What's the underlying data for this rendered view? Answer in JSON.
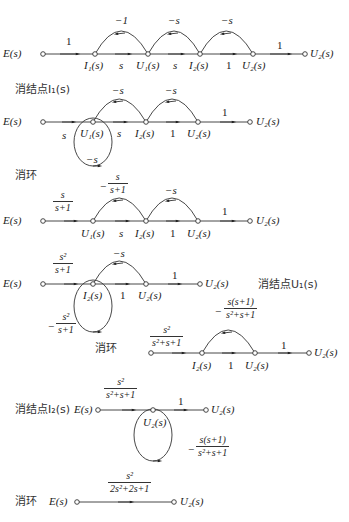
{
  "graphs": [
    {
      "id": "g1",
      "nodes": [
        "E(s)",
        "I1(s)",
        "U1(s)",
        "I2(s)",
        "U2(s)",
        "U2(s)"
      ],
      "labels": {
        "e": "E(s)",
        "i1": "I₁(s)",
        "u1": "U₁(s)",
        "i2": "I₂(s)",
        "u2": "U₂(s)",
        "out": "U₂(s)",
        "g_e_i1": "1",
        "g_i1_u1": "s",
        "g_u1_i2": "s",
        "g_i2_u2": "1",
        "g_u2_out": "1",
        "fb1": "−1",
        "fb2": "−s",
        "fb3": "−s"
      }
    },
    {
      "id": "g2",
      "step": "消结点I₁(s)",
      "labels": {
        "e": "E(s)",
        "u1": "U₁(s)",
        "i2": "I₂(s)",
        "u2": "U₂(s)",
        "out": "U₂(s)",
        "g_e_u1": "s",
        "g_u1_i2": "s",
        "g_i2_u2": "1",
        "g_u2_out": "1",
        "fb1": "−s",
        "fb2": "−s",
        "self_loop": "−s"
      }
    },
    {
      "id": "g3",
      "step": "消环",
      "labels": {
        "e": "E(s)",
        "u1": "U₁(s)",
        "i2": "I₂(s)",
        "u2": "U₂(s)",
        "out": "U₂(s)",
        "g_e_u1_num": "s",
        "g_e_u1_den": "s+1",
        "fb1_sign": "−",
        "fb1_num": "s",
        "fb1_den": "s+1",
        "g_u1_i2": "s",
        "g_i2_u2": "1",
        "g_u2_out": "1",
        "fb2": "−s"
      }
    },
    {
      "id": "g4",
      "step": "消结点U₁(s)",
      "labels": {
        "e": "E(s)",
        "i2": "I₂(s)",
        "u2": "U₂(s)",
        "out": "U₂(s)",
        "g_e_i2_num": "s²",
        "g_e_i2_den": "s+1",
        "g_i2_u2": "1",
        "g_u2_out": "1",
        "fb": "−s",
        "self_sign": "−",
        "self_num": "s²",
        "self_den": "s+1"
      }
    },
    {
      "id": "g5",
      "step": "消环",
      "labels": {
        "i2": "I₂(s)",
        "u2": "U₂(s)",
        "out": "U₂(s)",
        "g_in_num": "s²",
        "g_in_den": "s²+s+1",
        "fb_sign": "−",
        "fb_num": "s(s+1)",
        "fb_den": "s²+s+1",
        "g_i2_u2": "1",
        "g_u2_out": "1"
      }
    },
    {
      "id": "g6",
      "step": "消结点I₂(s)",
      "labels": {
        "e": "E(s)",
        "u2": "U₂(s)",
        "out": "U₂(s)",
        "g_in_num": "s²",
        "g_in_den": "s²+s+1",
        "g_out": "1",
        "self_sign": "−",
        "self_num": "s(s+1)",
        "self_den": "s²+s+1"
      }
    },
    {
      "id": "g7",
      "step": "消环",
      "labels": {
        "e": "E(s)",
        "out": "U₂(s)",
        "g_num": "s²",
        "g_den": "2s²+2s+1"
      }
    }
  ]
}
